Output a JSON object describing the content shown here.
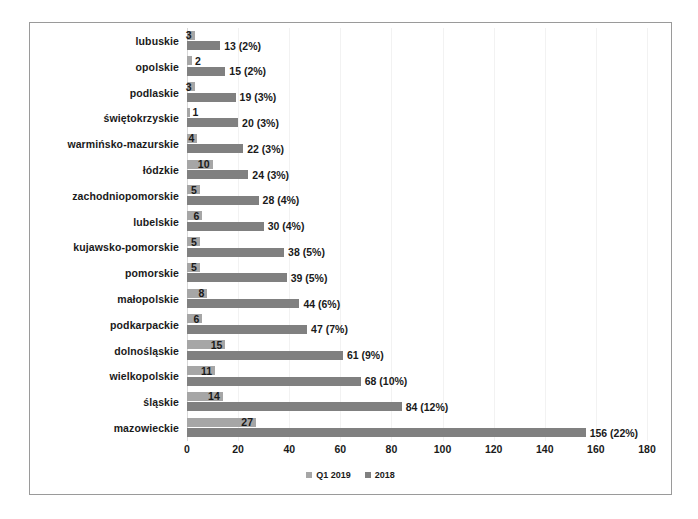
{
  "chart_data": {
    "type": "bar",
    "orientation": "horizontal",
    "title": "",
    "subtitle": "",
    "xlabel": "",
    "ylabel": "",
    "xlim": [
      0,
      180
    ],
    "xticks": [
      0,
      20,
      40,
      60,
      80,
      100,
      120,
      140,
      160,
      180
    ],
    "grid": true,
    "grid_axis": "x",
    "legend_position": "bottom",
    "categories": [
      "lubuskie",
      "opolskie",
      "podlaskie",
      "świętokrzyskie",
      "warmińsko-mazurskie",
      "łódzkie",
      "zachodniopomorskie",
      "lubelskie",
      "kujawsko-pomorskie",
      "pomorskie",
      "małopolskie",
      "podkarpackie",
      "dolnośląskie",
      "wielkopolskie",
      "śląskie",
      "mazowieckie"
    ],
    "series": [
      {
        "name": "Q1 2019",
        "color": "#a6a6a6",
        "values": [
          3,
          2,
          3,
          1,
          4,
          10,
          5,
          6,
          5,
          5,
          8,
          6,
          15,
          11,
          14,
          27
        ],
        "labels": [
          "3",
          "2",
          "3",
          "1",
          "4",
          "10",
          "5",
          "6",
          "5",
          "5",
          "8",
          "6",
          "15",
          "11",
          "14",
          "27"
        ]
      },
      {
        "name": "2018",
        "color": "#808080",
        "values": [
          13,
          15,
          19,
          20,
          22,
          24,
          28,
          30,
          38,
          39,
          44,
          47,
          61,
          68,
          84,
          156
        ],
        "percents": [
          "2%",
          "2%",
          "3%",
          "3%",
          "3%",
          "3%",
          "4%",
          "4%",
          "5%",
          "5%",
          "6%",
          "7%",
          "9%",
          "10%",
          "12%",
          "22%"
        ],
        "labels": [
          "13 (2%)",
          "15 (2%)",
          "19 (3%)",
          "20 (3%)",
          "22 (3%)",
          "24 (3%)",
          "28 (4%)",
          "30 (4%)",
          "38 (5%)",
          "39 (5%)",
          "44 (6%)",
          "47 (7%)",
          "61 (9%)",
          "68 (10%)",
          "84 (12%)",
          "156 (22%)"
        ]
      }
    ]
  },
  "legend": {
    "items": [
      {
        "label": "Q1 2019",
        "color": "#a6a6a6"
      },
      {
        "label": "2018",
        "color": "#808080"
      }
    ]
  },
  "colors": {
    "series_q1_2019": "#a6a6a6",
    "series_2018": "#808080",
    "border": "#9a9a9a",
    "gridline": "#f2f2f2",
    "text": "#1a1a1a",
    "background": "#ffffff"
  }
}
